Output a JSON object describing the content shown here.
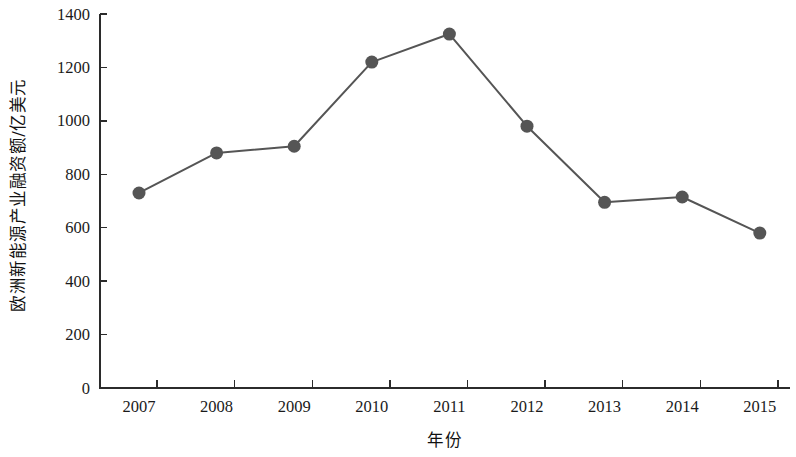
{
  "chart_data": {
    "type": "line",
    "title": "",
    "subtitle": "",
    "xlabel": "年份",
    "ylabel": "欧洲新能源产业融资额/亿美元",
    "categories": [
      "2007",
      "2008",
      "2009",
      "2010",
      "2011",
      "2012",
      "2013",
      "2014",
      "2015"
    ],
    "x": [
      2007,
      2008,
      2009,
      2010,
      2011,
      2012,
      2013,
      2014,
      2015
    ],
    "values": [
      730,
      880,
      905,
      1220,
      1325,
      980,
      695,
      715,
      580
    ],
    "series": [
      {
        "name": "欧洲新能源产业融资额",
        "values": [
          730,
          880,
          905,
          1220,
          1325,
          980,
          695,
          715,
          580
        ]
      }
    ],
    "ylim": [
      0,
      1400
    ],
    "ytick_labels": [
      "0",
      "200",
      "400",
      "600",
      "800",
      "1000",
      "1200",
      "1400"
    ],
    "yticks": [
      0,
      200,
      400,
      600,
      800,
      1000,
      1200,
      1400
    ],
    "xtick_labels": [
      "2007",
      "2008",
      "2009",
      "2010",
      "2011",
      "2012",
      "2013",
      "2014",
      "2015"
    ],
    "grid": false,
    "legend": false,
    "legend_position": "none",
    "marker": "circle",
    "line_color": "#555555",
    "marker_color": "#555555",
    "axis_color": "#2b2b2b",
    "background_color": "#ffffff"
  }
}
